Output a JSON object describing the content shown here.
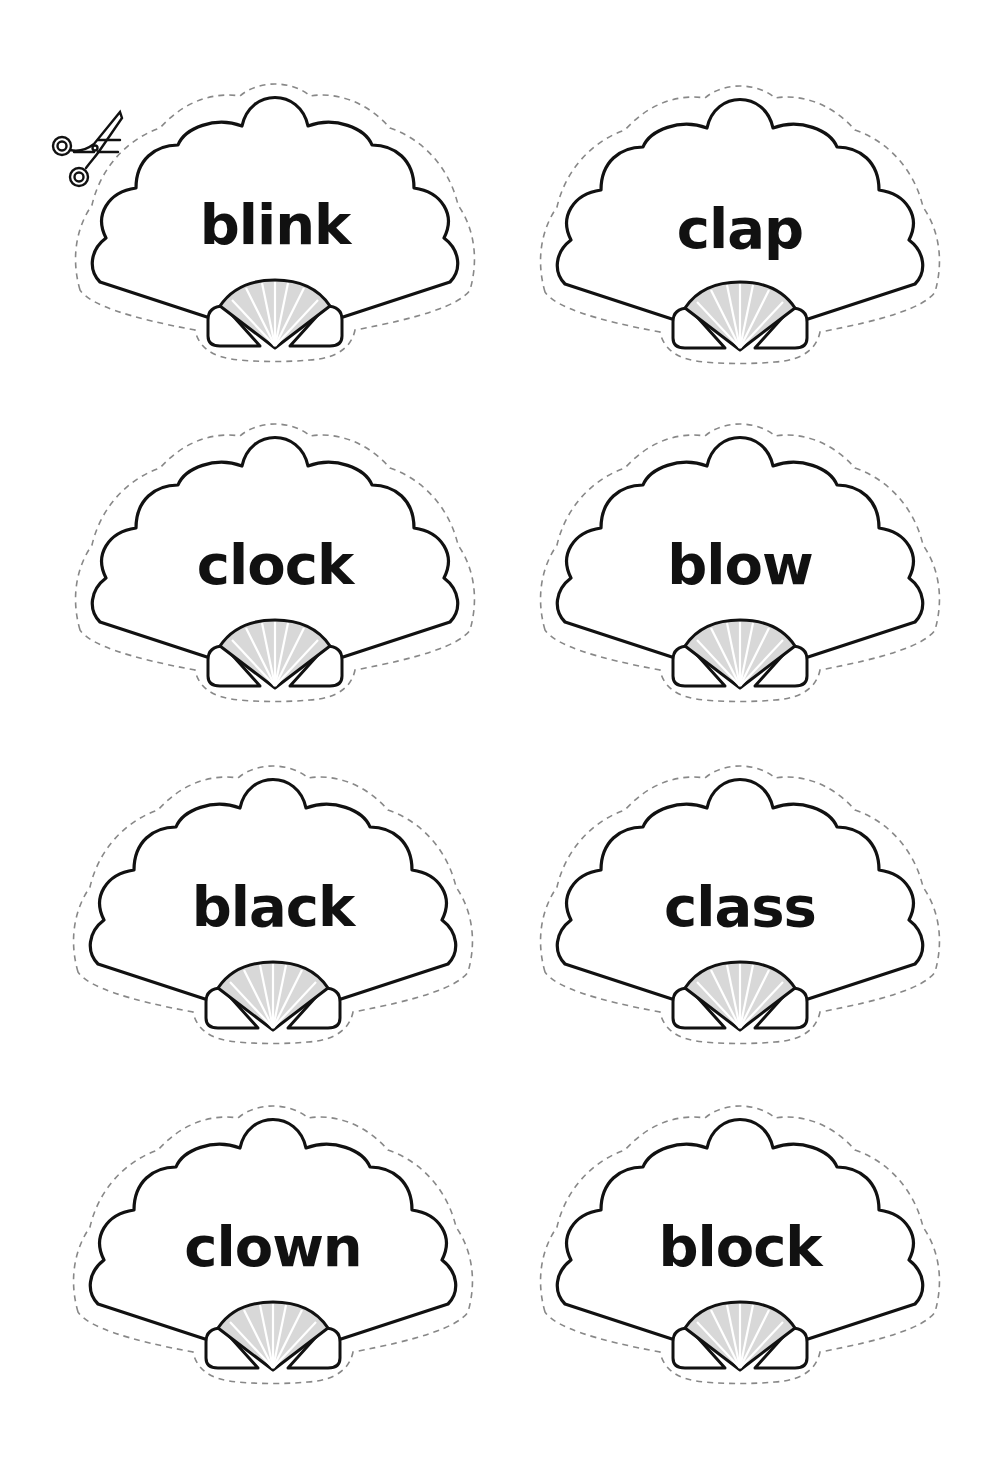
{
  "sheet": {
    "type": "cut-out word cards",
    "icon": "scissors-icon",
    "colors": {
      "outline": "#111111",
      "cut_line": "#888888",
      "shell_fill": "#d8d8d8",
      "background": "#ffffff"
    }
  },
  "cards": [
    {
      "word": "blink",
      "column": 0,
      "row": 0
    },
    {
      "word": "clap",
      "column": 1,
      "row": 0
    },
    {
      "word": "clock",
      "column": 0,
      "row": 1
    },
    {
      "word": "blow",
      "column": 1,
      "row": 1
    },
    {
      "word": "black",
      "column": 0,
      "row": 2
    },
    {
      "word": "class",
      "column": 1,
      "row": 2
    },
    {
      "word": "clown",
      "column": 0,
      "row": 3
    },
    {
      "word": "block",
      "column": 1,
      "row": 3
    }
  ]
}
